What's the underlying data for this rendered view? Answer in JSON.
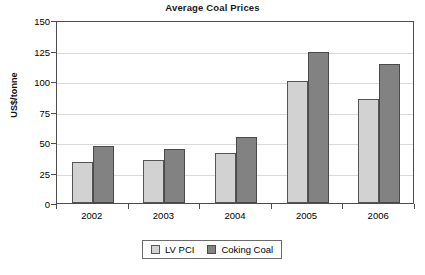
{
  "chart_data": {
    "type": "bar",
    "title": "Average Coal Prices",
    "xlabel": "",
    "ylabel": "US$/tonne",
    "categories": [
      "2002",
      "2003",
      "2004",
      "2005",
      "2006"
    ],
    "series": [
      {
        "name": "LV PCI",
        "color": "#d2d2d2",
        "values": [
          34,
          35,
          41,
          100,
          85
        ]
      },
      {
        "name": "Coking Coal",
        "color": "#828282",
        "values": [
          47,
          44,
          54,
          124,
          114
        ]
      }
    ],
    "ylim": [
      0,
      150
    ],
    "yticks": [
      0,
      25,
      50,
      75,
      100,
      125,
      150
    ],
    "ytick_labels": [
      "0",
      "25",
      "50",
      "75",
      "100",
      "125",
      "150"
    ],
    "grid": true,
    "legend_position": "bottom-center"
  }
}
